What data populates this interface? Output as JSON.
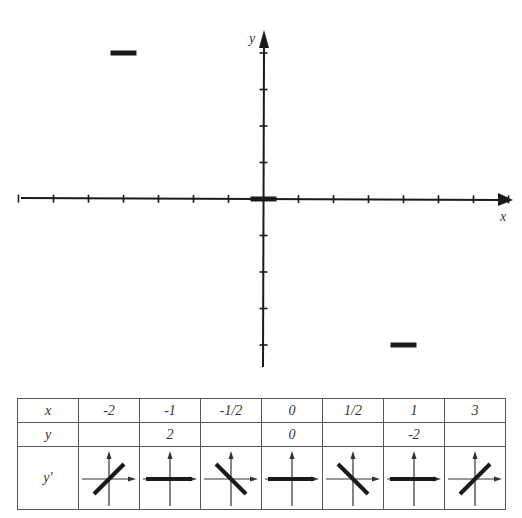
{
  "chart_data": {
    "type": "scatter",
    "title": "",
    "xlabel": "x",
    "ylabel": "y",
    "grid": false,
    "x_ticks_count_left": 7,
    "x_ticks_count_right": 7,
    "y_ticks_count_up": 4,
    "y_ticks_count_down": 4,
    "line_elements": [
      {
        "x": -1,
        "y": 2,
        "slope": 0
      },
      {
        "x": 0,
        "y": 0,
        "slope": 0
      },
      {
        "x": 1,
        "y": -2,
        "slope": 0
      }
    ]
  },
  "axes": {
    "x_label": "x",
    "y_label": "y"
  },
  "table": {
    "rows": [
      {
        "header": "x",
        "cells": [
          "-2",
          "-1",
          "-1/2",
          "0",
          "1/2",
          "1",
          "3"
        ]
      },
      {
        "header": "y",
        "cells": [
          "",
          "2",
          "",
          "0",
          "",
          "-2",
          ""
        ]
      },
      {
        "header": "y′",
        "slopes": [
          "positive",
          "zero",
          "negative",
          "zero",
          "negative",
          "zero",
          "positive"
        ]
      }
    ]
  },
  "colors": {
    "ink": "#1a1a1a",
    "border": "#555555",
    "background": "#ffffff"
  }
}
